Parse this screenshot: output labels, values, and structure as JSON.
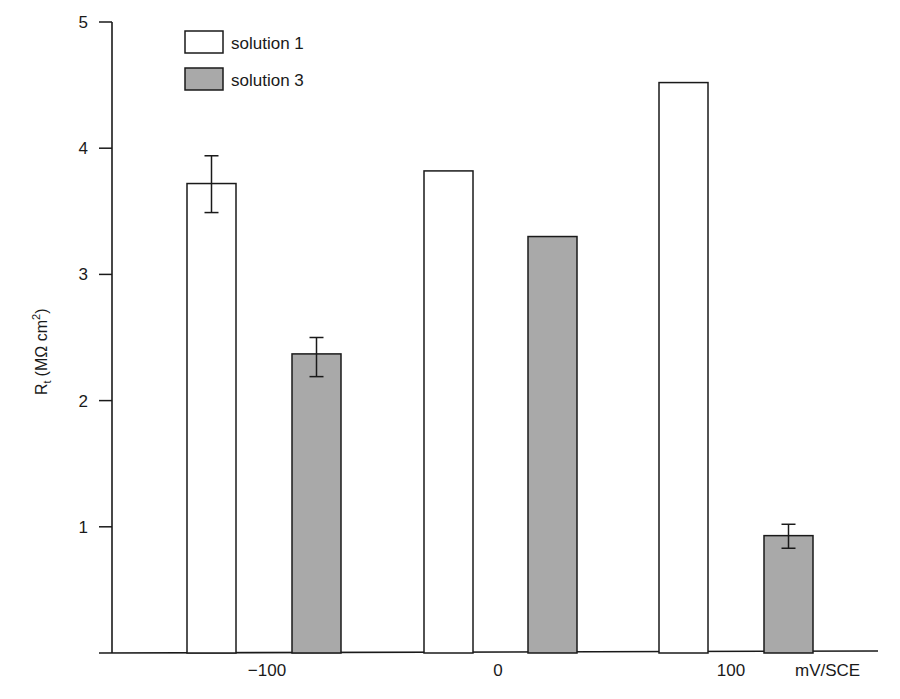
{
  "chart_data": {
    "type": "bar",
    "title": "",
    "xlabel": "mV/SCE",
    "ylabel": "R_t (MΩ cm²)",
    "ylabel_parts": {
      "main": "R",
      "sub": "t",
      "unit": "(MΩ cm",
      "sup": "2",
      "close": ")"
    },
    "ylim": [
      0,
      5
    ],
    "yticks": [
      1,
      2,
      3,
      4,
      5
    ],
    "categories": [
      "−100",
      "0",
      "100"
    ],
    "series": [
      {
        "name": "solution 1",
        "color": "#ffffff",
        "values": [
          3.72,
          3.82,
          4.52
        ],
        "error_low": [
          3.49,
          null,
          null
        ],
        "error_high": [
          3.94,
          null,
          null
        ]
      },
      {
        "name": "solution 3",
        "color": "#a9a9a9",
        "values": [
          2.37,
          3.3,
          0.93
        ],
        "error_low": [
          2.19,
          null,
          0.83
        ],
        "error_high": [
          2.5,
          null,
          1.02
        ]
      }
    ],
    "grid": false,
    "legend_position": "upper-left"
  },
  "legend": {
    "items": [
      {
        "label": "solution 1"
      },
      {
        "label": "solution 3"
      }
    ]
  },
  "axes": {
    "x_unit_label": "mV/SCE",
    "y_tick_labels": [
      "1",
      "2",
      "3",
      "4",
      "5"
    ],
    "x_tick_labels": [
      "−100",
      "0",
      "100"
    ]
  }
}
